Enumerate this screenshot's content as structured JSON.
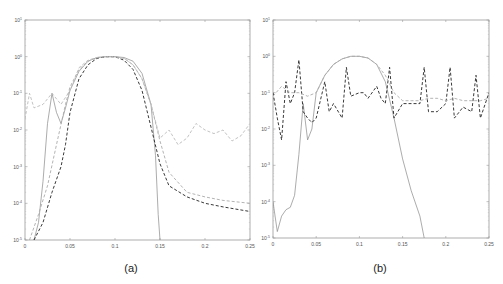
{
  "figure": {
    "panels": [
      "(a)",
      "(b)"
    ]
  },
  "chart_data": [
    {
      "type": "line",
      "panel_label": "(a)",
      "title": "",
      "xlabel": "",
      "ylabel": "",
      "xscale": "linear",
      "yscale": "log",
      "xlim": [
        0,
        0.25
      ],
      "ylim": [
        1e-05,
        10
      ],
      "xticks": [
        "0",
        "0.05",
        "0.1",
        "0.15",
        "0.2",
        "0.25"
      ],
      "yticks": [
        "10^-5",
        "10^-4",
        "10^-3",
        "10^-2",
        "10^-1",
        "10^0",
        "10^1"
      ],
      "grid": false,
      "legend": null,
      "series": [
        {
          "name": "solid gray",
          "style": "solid",
          "color": "#888888",
          "x": [
            0.01,
            0.015,
            0.02,
            0.025,
            0.03,
            0.035,
            0.04,
            0.045,
            0.05,
            0.06,
            0.07,
            0.08,
            0.09,
            0.1,
            0.11,
            0.12,
            0.13,
            0.14,
            0.145,
            0.148,
            0.15
          ],
          "y": [
            1e-05,
            3e-05,
            0.0004,
            0.015,
            0.1,
            0.03,
            0.015,
            0.04,
            0.12,
            0.4,
            0.75,
            0.95,
            1.0,
            1.0,
            0.95,
            0.75,
            0.35,
            0.05,
            0.002,
            5e-05,
            1e-05
          ]
        },
        {
          "name": "black dashed",
          "style": "dashed",
          "color": "#222222",
          "x": [
            0.01,
            0.02,
            0.03,
            0.04,
            0.045,
            0.05,
            0.06,
            0.07,
            0.08,
            0.09,
            0.1,
            0.11,
            0.12,
            0.13,
            0.14,
            0.15,
            0.16,
            0.18,
            0.2,
            0.22,
            0.25
          ],
          "y": [
            1e-05,
            3e-05,
            0.0002,
            0.001,
            0.004,
            0.03,
            0.25,
            0.6,
            0.9,
            1.0,
            1.0,
            0.8,
            0.45,
            0.12,
            0.012,
            0.0012,
            0.0003,
            0.00015,
            0.0001,
            8e-05,
            6e-05
          ]
        },
        {
          "name": "light gray dashed (lower)",
          "style": "dashed",
          "color": "#aaaaaa",
          "x": [
            0.005,
            0.015,
            0.025,
            0.035,
            0.045,
            0.05,
            0.06,
            0.07,
            0.08,
            0.09,
            0.1,
            0.11,
            0.12,
            0.13,
            0.14,
            0.15,
            0.16,
            0.18,
            0.2,
            0.22,
            0.25
          ],
          "y": [
            1e-05,
            5e-05,
            0.0003,
            0.004,
            0.05,
            0.15,
            0.45,
            0.75,
            0.95,
            1.0,
            1.0,
            0.9,
            0.6,
            0.25,
            0.05,
            0.005,
            0.0007,
            0.0002,
            0.00015,
            0.00012,
            0.0001
          ]
        },
        {
          "name": "light gray dashed (upper)",
          "style": "dashed",
          "color": "#bbbbbb",
          "x": [
            0.0,
            0.005,
            0.01,
            0.02,
            0.03,
            0.04,
            0.05,
            0.06,
            0.07,
            0.08,
            0.09,
            0.1,
            0.11,
            0.12,
            0.13,
            0.14,
            0.15,
            0.16,
            0.17,
            0.18,
            0.19,
            0.2,
            0.21,
            0.22,
            0.23,
            0.24,
            0.25
          ],
          "y": [
            0.02,
            0.1,
            0.04,
            0.05,
            0.1,
            0.05,
            0.12,
            0.5,
            0.8,
            0.95,
            1.0,
            1.0,
            0.9,
            0.6,
            0.25,
            0.05,
            0.006,
            0.01,
            0.004,
            0.006,
            0.015,
            0.01,
            0.008,
            0.01,
            0.005,
            0.007,
            0.015
          ]
        }
      ]
    },
    {
      "type": "line",
      "panel_label": "(b)",
      "title": "",
      "xlabel": "",
      "ylabel": "",
      "xscale": "linear",
      "yscale": "log",
      "xlim": [
        0,
        0.25
      ],
      "ylim": [
        1e-05,
        10
      ],
      "xticks": [
        "0",
        "0.05",
        "0.1",
        "0.15",
        "0.2",
        "0.25"
      ],
      "yticks": [
        "10^-5",
        "10^-4",
        "10^-3",
        "10^-2",
        "10^-1",
        "10^0",
        "10^1"
      ],
      "grid": false,
      "legend": null,
      "series": [
        {
          "name": "solid gray",
          "style": "solid",
          "color": "#888888",
          "x": [
            0.0,
            0.005,
            0.01,
            0.015,
            0.02,
            0.025,
            0.03,
            0.035,
            0.04,
            0.045,
            0.05,
            0.06,
            0.07,
            0.08,
            0.09,
            0.1,
            0.11,
            0.12,
            0.13,
            0.14,
            0.15,
            0.16,
            0.17,
            0.175
          ],
          "y": [
            0.0001,
            1.5e-05,
            4e-05,
            6e-05,
            7e-05,
            0.00015,
            0.002,
            0.05,
            0.005,
            0.01,
            0.1,
            0.3,
            0.6,
            0.85,
            1.0,
            1.0,
            0.9,
            0.6,
            0.2,
            0.02,
            0.0015,
            0.0002,
            4e-05,
            1e-05
          ]
        },
        {
          "name": "black dashed",
          "style": "dashed",
          "color": "#222222",
          "x": [
            0.0,
            0.005,
            0.01,
            0.015,
            0.02,
            0.025,
            0.03,
            0.035,
            0.04,
            0.045,
            0.05,
            0.06,
            0.065,
            0.07,
            0.08,
            0.085,
            0.09,
            0.1,
            0.105,
            0.11,
            0.12,
            0.125,
            0.13,
            0.135,
            0.14,
            0.15,
            0.16,
            0.17,
            0.175,
            0.18,
            0.19,
            0.2,
            0.205,
            0.21,
            0.22,
            0.23,
            0.235,
            0.24,
            0.25
          ],
          "y": [
            0.1,
            0.02,
            0.005,
            0.2,
            0.05,
            0.1,
            0.8,
            0.03,
            0.02,
            0.015,
            0.02,
            0.2,
            0.03,
            0.05,
            0.02,
            0.5,
            0.08,
            0.1,
            0.1,
            0.07,
            0.15,
            0.07,
            0.05,
            0.5,
            0.02,
            0.05,
            0.05,
            0.05,
            0.5,
            0.03,
            0.03,
            0.05,
            0.5,
            0.02,
            0.04,
            0.03,
            0.3,
            0.02,
            0.1
          ]
        },
        {
          "name": "light gray dashed",
          "style": "dashed",
          "color": "#aaaaaa",
          "x": [
            0.0,
            0.01,
            0.02,
            0.03,
            0.04,
            0.05,
            0.06,
            0.07,
            0.08,
            0.09,
            0.1,
            0.11,
            0.12,
            0.13,
            0.14,
            0.15,
            0.16,
            0.17,
            0.18,
            0.19,
            0.2,
            0.21,
            0.22,
            0.23,
            0.24,
            0.25
          ],
          "y": [
            0.08,
            0.15,
            0.1,
            0.1,
            0.08,
            0.1,
            0.3,
            0.6,
            0.85,
            1.0,
            1.0,
            0.9,
            0.6,
            0.3,
            0.1,
            0.06,
            0.06,
            0.06,
            0.07,
            0.07,
            0.06,
            0.07,
            0.06,
            0.06,
            0.06,
            0.07
          ]
        }
      ]
    }
  ]
}
